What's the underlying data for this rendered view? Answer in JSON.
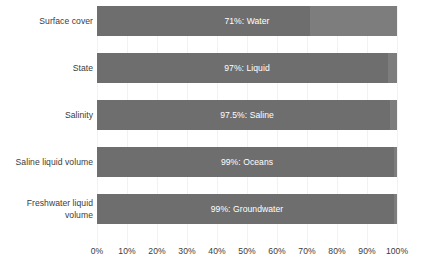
{
  "chart_data": {
    "type": "bar",
    "orientation": "horizontal",
    "stacked": true,
    "title": "",
    "subtitle": "",
    "xlabel": "",
    "ylabel": "",
    "xlim": [
      0,
      100
    ],
    "grid": true,
    "legend": "none",
    "xticks": [
      "0%",
      "10%",
      "20%",
      "30%",
      "40%",
      "50%",
      "60%",
      "70%",
      "80%",
      "90%",
      "100%"
    ],
    "xtick_values": [
      0,
      10,
      20,
      30,
      40,
      50,
      60,
      70,
      80,
      90,
      100
    ],
    "categories": [
      "Surface cover",
      "State",
      "Salinity",
      "Saline liquid volume",
      "Freshwater liquid volume"
    ],
    "values": [
      71,
      97,
      97.5,
      99,
      99
    ],
    "bars": [
      {
        "category": "Surface cover",
        "label_lines": [
          "Surface cover"
        ],
        "value": 71,
        "bar_label": "71%: Water",
        "remainder": 29
      },
      {
        "category": "State",
        "label_lines": [
          "State"
        ],
        "value": 97,
        "bar_label": "97%: Liquid",
        "remainder": 3
      },
      {
        "category": "Salinity",
        "label_lines": [
          "Salinity"
        ],
        "value": 97.5,
        "bar_label": "97.5%: Saline",
        "remainder": 2.5
      },
      {
        "category": "Saline liquid volume",
        "label_lines": [
          "Saline liquid volume"
        ],
        "value": 99,
        "bar_label": "99%: Oceans",
        "remainder": 1
      },
      {
        "category": "Freshwater liquid volume",
        "label_lines": [
          "Freshwater liquid",
          "volume"
        ],
        "value": 99,
        "bar_label": "99%: Groundwater",
        "remainder": 1
      }
    ]
  },
  "colors": {
    "primary_segment": "#6e6e6e",
    "remainder_segment": "#7d7d7d",
    "background": "#ffffff",
    "gridline": "#f2f2f2",
    "label_text": "#3b3b3b",
    "bar_label_text": "#ffffff"
  }
}
